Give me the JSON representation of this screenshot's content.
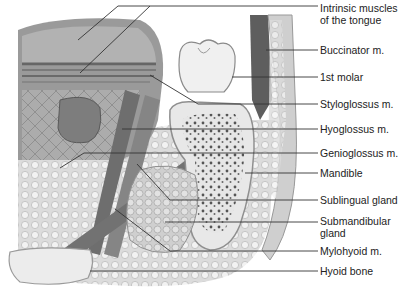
{
  "figure": {
    "labels": [
      {
        "id": "intrinsic-muscles",
        "text_line1": "Intrinsic muscles",
        "text_line2": "of the tongue",
        "y": 4
      },
      {
        "id": "buccinator",
        "text_line1": "Buccinator m.",
        "text_line2": "",
        "y": 44
      },
      {
        "id": "first-molar",
        "text_line1": "1st molar",
        "text_line2": "",
        "y": 72
      },
      {
        "id": "styloglossus",
        "text_line1": "Styloglossus m.",
        "text_line2": "",
        "y": 99
      },
      {
        "id": "hyoglossus",
        "text_line1": "Hyoglossus m.",
        "text_line2": "",
        "y": 124
      },
      {
        "id": "genioglossus",
        "text_line1": "Genioglossus m.",
        "text_line2": "",
        "y": 148
      },
      {
        "id": "mandible",
        "text_line1": "Mandible",
        "text_line2": "",
        "y": 168
      },
      {
        "id": "sublingual-gland",
        "text_line1": "Sublingual gland",
        "text_line2": "",
        "y": 195
      },
      {
        "id": "submandibular-gland",
        "text_line1": "Submandibular",
        "text_line2": "gland",
        "y": 215
      },
      {
        "id": "mylohyoid",
        "text_line1": "Mylohyoid m.",
        "text_line2": "",
        "y": 246
      },
      {
        "id": "hyoid-bone",
        "text_line1": "Hyoid bone",
        "text_line2": "",
        "y": 265
      }
    ],
    "colors": {
      "background": "#ffffff",
      "leader_line": "#333333",
      "tissue_dark": "#6e6e6e",
      "tissue_mid": "#a8a8a8",
      "tissue_light": "#d6d6d6",
      "bone": "#e4e4e4",
      "tooth": "#eeeeee"
    }
  }
}
